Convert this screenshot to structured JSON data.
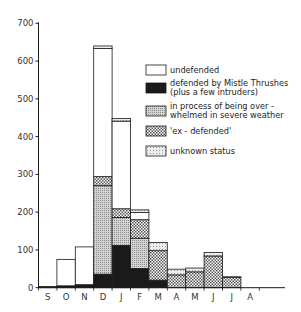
{
  "chart_data": {
    "type": "bar",
    "stacked": true,
    "title": "",
    "xlabel": "",
    "ylabel": "",
    "ylim": [
      0,
      700
    ],
    "yticks": [
      0,
      100,
      200,
      300,
      400,
      500,
      600,
      700
    ],
    "grid": false,
    "legend_position": "right-inside",
    "categories": [
      "S",
      "O",
      "N",
      "D",
      "J",
      "F",
      "M",
      "A",
      "M",
      "J",
      "J",
      "A"
    ],
    "series": [
      {
        "name": "defended by Mistle Thrushes (plus a few intruders)",
        "key": "defended",
        "pattern": "black",
        "values": [
          3,
          5,
          8,
          36,
          112,
          51,
          20,
          0,
          0,
          0,
          0,
          0
        ]
      },
      {
        "name": "in process of being over-whelmed in severe weather",
        "key": "severe",
        "pattern": "fine-dots",
        "values": [
          0,
          0,
          0,
          234,
          74,
          80,
          0,
          0,
          0,
          0,
          0,
          0
        ]
      },
      {
        "name": "'ex-defended'",
        "key": "exdefended",
        "pattern": "checker",
        "values": [
          0,
          0,
          0,
          24,
          23,
          49,
          78,
          34,
          42,
          84,
          27,
          0
        ]
      },
      {
        "name": "undefended",
        "key": "undefended",
        "pattern": "white",
        "values": [
          0,
          70,
          100,
          339,
          232,
          19,
          0,
          0,
          0,
          0,
          0,
          0
        ]
      },
      {
        "name": "unknown status",
        "key": "unknown",
        "pattern": "sparse-dots",
        "values": [
          0,
          0,
          0,
          7,
          7,
          7,
          22,
          15,
          10,
          9,
          2,
          0
        ]
      }
    ],
    "totals": [
      3,
      75,
      108,
      640,
      448,
      206,
      120,
      49,
      52,
      93,
      29,
      0
    ]
  },
  "legend": {
    "items": [
      {
        "label_line1": "undefended",
        "label_line2": ""
      },
      {
        "label_line1": "defended by Mistle Thrushes",
        "label_line2": "(plus a few intruders)"
      },
      {
        "label_line1": "in process of being over -",
        "label_line2": "whelmed in severe weather"
      },
      {
        "label_line1": "'ex - defended'",
        "label_line2": ""
      },
      {
        "label_line1": "unknown status",
        "label_line2": ""
      }
    ]
  },
  "axis": {
    "y_tick_labels": [
      "0",
      "100",
      "200",
      "300",
      "400",
      "500",
      "600",
      "700"
    ],
    "x_tick_labels": [
      "S",
      "O",
      "N",
      "D",
      "J",
      "F",
      "M",
      "A",
      "M",
      "J",
      "J",
      "A"
    ]
  },
  "colors": {
    "ink": "#1a1a1a",
    "background": "#ffffff"
  }
}
